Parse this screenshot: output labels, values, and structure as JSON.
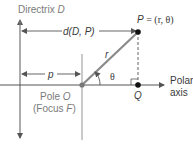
{
  "diagram": {
    "type": "polar-conic-definition",
    "labels": {
      "directrix_prefix": "Directrix ",
      "directrix_name": "D",
      "distance_label_d": "d",
      "distance_label_args": "(D, P)",
      "p_label": "p",
      "r_label": "r",
      "theta_label": "θ",
      "point_p_name": "P",
      "point_p_eq": " = (r, θ)",
      "q_label": "Q",
      "pole_prefix": "Pole ",
      "pole_name": "O",
      "focus_open": "(Focus ",
      "focus_name": "F",
      "focus_close": ")",
      "polar_line1": "Polar",
      "polar_line2": "axis"
    },
    "colors": {
      "line": "#555555",
      "radius": "#8a8a8a",
      "point": "#111111",
      "pole": "#777777",
      "label_gray": "#7a7a7a",
      "label_dark": "#3a3a3a"
    }
  }
}
